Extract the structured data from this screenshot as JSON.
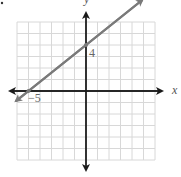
{
  "chart_data": {
    "type": "line",
    "title": "",
    "xlabel": "x",
    "ylabel": "y",
    "xlim": [
      -6,
      6
    ],
    "ylim": [
      -6,
      6
    ],
    "grid": true,
    "series": [
      {
        "name": "line",
        "equation": "y = (4/5)x + 4",
        "points": [
          [
            -5,
            0
          ],
          [
            0,
            4
          ]
        ],
        "x": [
          -6,
          5
        ],
        "y": [
          -0.8,
          8
        ],
        "color": "#7a7a7a"
      }
    ],
    "annotations": [
      {
        "text": "4",
        "x": 0,
        "y": 4
      },
      {
        "text": "−5",
        "x": -5,
        "y": 0
      }
    ]
  },
  "labels": {
    "y_intercept": "4",
    "x_intercept": "−5",
    "x_axis": "x",
    "y_axis": "y"
  },
  "colors": {
    "grid": "#d8d8d8",
    "axis": "#1a1a1a",
    "line": "#7a7a7a"
  }
}
